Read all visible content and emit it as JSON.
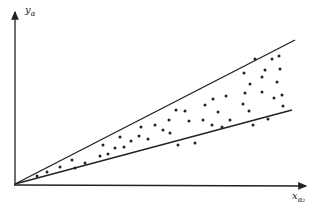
{
  "diagram": {
    "y_axis_label": "y",
    "y_axis_subscript": "α",
    "x_axis_label": "x",
    "x_axis_subscript": "α₂",
    "colors": {
      "ink": "#222222",
      "background": "#ffffff"
    },
    "origin": [
      15,
      184
    ],
    "upper_line_end": [
      295,
      40
    ],
    "lower_line_end": [
      292,
      110
    ],
    "points": [
      [
        37,
        176
      ],
      [
        47,
        172
      ],
      [
        60,
        167
      ],
      [
        72,
        160
      ],
      [
        75,
        168
      ],
      [
        85,
        163
      ],
      [
        100,
        156
      ],
      [
        103,
        145
      ],
      [
        108,
        154
      ],
      [
        115,
        148
      ],
      [
        120,
        137
      ],
      [
        124,
        147
      ],
      [
        131,
        141
      ],
      [
        139,
        136
      ],
      [
        141,
        127
      ],
      [
        148,
        139
      ],
      [
        155,
        125
      ],
      [
        163,
        130
      ],
      [
        169,
        120
      ],
      [
        170,
        133
      ],
      [
        176,
        110
      ],
      [
        178,
        145
      ],
      [
        185,
        111
      ],
      [
        189,
        121
      ],
      [
        195,
        143
      ],
      [
        203,
        120
      ],
      [
        205,
        105
      ],
      [
        212,
        125
      ],
      [
        213,
        99
      ],
      [
        218,
        112
      ],
      [
        222,
        127
      ],
      [
        226,
        96
      ],
      [
        230,
        120
      ],
      [
        243,
        104
      ],
      [
        245,
        93
      ],
      [
        249,
        111
      ],
      [
        253,
        125
      ],
      [
        262,
        92
      ],
      [
        265,
        70
      ],
      [
        268,
        119
      ],
      [
        274,
        98
      ],
      [
        277,
        82
      ],
      [
        282,
        95
      ],
      [
        283,
        106
      ],
      [
        262,
        77
      ],
      [
        244,
        73
      ],
      [
        250,
        84
      ],
      [
        255,
        59
      ],
      [
        272,
        59
      ],
      [
        279,
        56
      ],
      [
        280,
        69
      ]
    ]
  }
}
